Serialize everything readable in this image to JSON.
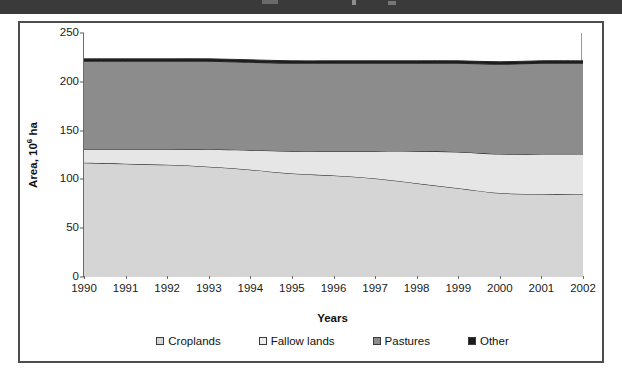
{
  "figure": {
    "background_color": "#ffffff",
    "frame_color": "#4d4d4d"
  },
  "chart_data": {
    "type": "area",
    "stacked": true,
    "title": "",
    "xlabel": "Years",
    "ylabel": "Area, 10⁶ ha",
    "ylabel_base": "Area, 10",
    "ylabel_exponent": "6",
    "ylabel_unit": " ha",
    "categories": [
      "1990",
      "1991",
      "1992",
      "1993",
      "1994",
      "1995",
      "1996",
      "1997",
      "1998",
      "1999",
      "2000",
      "2001",
      "2002"
    ],
    "x": [
      1990,
      1991,
      1992,
      1993,
      1994,
      1995,
      1996,
      1997,
      1998,
      1999,
      2000,
      2001,
      2002
    ],
    "ylim": [
      0,
      250
    ],
    "yticks": [
      0,
      50,
      100,
      150,
      200,
      250
    ],
    "ytick_labels": [
      "0",
      "50",
      "100",
      "150",
      "200",
      "250"
    ],
    "grid": false,
    "legend_position": "bottom",
    "series": [
      {
        "name": "Croplands",
        "color": "#d5d5d5",
        "values": [
          117,
          116,
          115,
          113,
          110,
          106,
          104,
          101,
          96,
          91,
          86,
          85,
          85
        ]
      },
      {
        "name": "Fallow lands",
        "color": "#e6e6e6",
        "values": [
          14,
          15,
          16,
          18,
          20,
          23,
          25,
          28,
          33,
          37,
          40,
          41,
          41
        ]
      },
      {
        "name": "Pastures",
        "color": "#8c8c8c",
        "values": [
          90,
          90,
          90,
          90,
          90,
          90,
          90,
          90,
          90,
          91,
          92,
          93,
          93
        ]
      },
      {
        "name": "Other",
        "color": "#1c1c1c",
        "values": [
          2.5,
          2.5,
          2.5,
          2.5,
          2.5,
          2.5,
          2.5,
          2.5,
          2.5,
          2.5,
          2.5,
          2.5,
          2.5
        ]
      }
    ],
    "cumulative_tops": {
      "croplands": [
        117,
        116,
        115,
        113,
        110,
        106,
        104,
        101,
        96,
        91,
        86,
        85,
        85
      ],
      "fallow_lands": [
        131,
        131,
        131,
        131,
        130,
        129,
        129,
        129,
        129,
        128,
        126,
        126,
        126
      ],
      "pastures": [
        221,
        221,
        221,
        221,
        220,
        219,
        219,
        219,
        219,
        219,
        218,
        219,
        219
      ],
      "other": [
        223.5,
        223.5,
        223.5,
        223.5,
        222.5,
        221.5,
        221.5,
        221.5,
        221.5,
        221.5,
        220.5,
        221.5,
        221.5
      ]
    }
  },
  "legend": {
    "items": [
      {
        "label": "Croplands",
        "color": "#d5d5d5"
      },
      {
        "label": "Fallow lands",
        "color": "#ededed"
      },
      {
        "label": "Pastures",
        "color": "#8c8c8c"
      },
      {
        "label": "Other",
        "color": "#1c1c1c"
      }
    ]
  }
}
